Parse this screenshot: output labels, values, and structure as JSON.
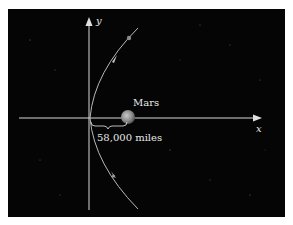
{
  "diagram": {
    "axes": {
      "x_label": "x",
      "y_label": "y"
    },
    "planet": {
      "label": "Mars"
    },
    "distance": {
      "label": "58,000 miles"
    },
    "colors": {
      "background": "#050505",
      "axis": "#d8d8d8",
      "curve": "#b9b9b9",
      "planet": "#8a8a8a"
    }
  }
}
